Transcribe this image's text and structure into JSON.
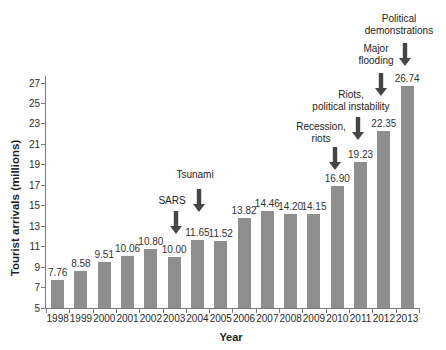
{
  "chart_data": {
    "type": "bar",
    "title": "",
    "xlabel": "Year",
    "ylabel": "Tourist arrivals (millions)",
    "categories": [
      "1998",
      "1999",
      "2000",
      "2001",
      "2002",
      "2003",
      "2004",
      "2005",
      "2006",
      "2007",
      "2008",
      "2009",
      "2010",
      "2011",
      "2012",
      "2013"
    ],
    "values": [
      7.76,
      8.58,
      9.51,
      10.06,
      10.8,
      10.0,
      11.65,
      11.52,
      13.82,
      14.46,
      14.2,
      14.15,
      16.9,
      19.23,
      22.35,
      26.74
    ],
    "value_labels": [
      "7.76",
      "8.58",
      "9.51",
      "10.06",
      "10.80",
      "10.00",
      "11.65",
      "11.52",
      "13.82",
      "14.46",
      "14.20",
      "14.15",
      "16.90",
      "19.23",
      "22.35",
      "26.74"
    ],
    "ylim": [
      5,
      27
    ],
    "yticks": [
      5,
      7,
      9,
      11,
      13,
      15,
      17,
      19,
      21,
      23,
      25,
      27
    ],
    "grid": "off",
    "legend": "none",
    "bar_color": "#8e8e8e",
    "arrow_color": "#454545",
    "annotations": [
      {
        "label": "SARS",
        "lines": [
          "SARS"
        ],
        "target_year": "2003"
      },
      {
        "label": "Tsunami",
        "lines": [
          "Tsunami"
        ],
        "target_year": "2004"
      },
      {
        "label": "Recession, riots",
        "lines": [
          "Recession,",
          "riots"
        ],
        "target_year": "2010"
      },
      {
        "label": "Riots, political instability",
        "lines": [
          "Riots,",
          "political instability"
        ],
        "target_year": "2011"
      },
      {
        "label": "Major flooding",
        "lines": [
          "Major",
          "flooding"
        ],
        "target_year": "2012"
      },
      {
        "label": "Political demonstrations",
        "lines": [
          "Political",
          "demonstrations"
        ],
        "target_year": "2013"
      }
    ]
  }
}
